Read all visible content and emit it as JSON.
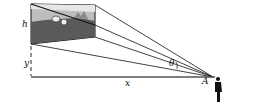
{
  "diagram": {
    "labels": {
      "h": "h",
      "y": "y",
      "x": "x",
      "theta": "θ",
      "A": "A"
    },
    "colors": {
      "line": "#111111",
      "picture_sky": "#cfcfcf",
      "picture_ground": "#555555"
    }
  }
}
